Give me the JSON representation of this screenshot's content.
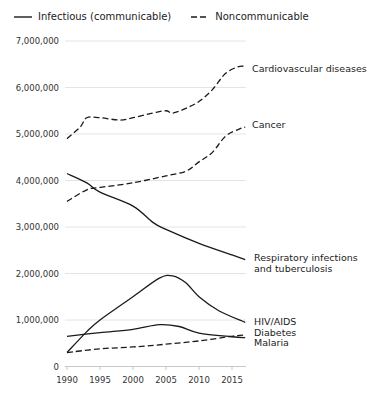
{
  "chart_data": {
    "type": "line",
    "title": "",
    "xlabel": "",
    "ylabel": "",
    "xlim": [
      1990,
      2017
    ],
    "ylim": [
      0,
      7000000
    ],
    "grid": true,
    "legend_position": "top-left",
    "legend": [
      {
        "label": "Infectious (communicable)",
        "style": "solid"
      },
      {
        "label": "Noncommunicable",
        "style": "dashed"
      }
    ],
    "x_ticks": [
      "1990",
      "1995",
      "2000",
      "2005",
      "2010",
      "2015"
    ],
    "y_ticks": [
      "0",
      "1,000,000",
      "2,000,000",
      "3,000,000",
      "4,000,000",
      "5,000,000",
      "6,000,000",
      "7,000,000"
    ],
    "series": [
      {
        "name": "Cardiovascular diseases",
        "group": "Noncommunicable",
        "style": "dashed",
        "x": [
          1990,
          1992,
          1993,
          1995,
          1998,
          2000,
          2003,
          2005,
          2006,
          2008,
          2010,
          2012,
          2014,
          2016,
          2017
        ],
        "values": [
          4900000,
          5150000,
          5350000,
          5350000,
          5300000,
          5350000,
          5450000,
          5500000,
          5450000,
          5550000,
          5700000,
          5950000,
          6300000,
          6450000,
          6450000
        ]
      },
      {
        "name": "Cancer",
        "group": "Noncommunicable",
        "style": "dashed",
        "x": [
          1990,
          1993,
          1995,
          2000,
          2005,
          2008,
          2010,
          2012,
          2014,
          2016,
          2017
        ],
        "values": [
          3550000,
          3800000,
          3850000,
          3950000,
          4100000,
          4200000,
          4400000,
          4600000,
          4950000,
          5100000,
          5150000
        ]
      },
      {
        "name": "Respiratory infections and tuberculosis",
        "group": "Infectious (communicable)",
        "style": "solid",
        "x": [
          1990,
          1993,
          1995,
          2000,
          2003,
          2005,
          2010,
          2015,
          2017
        ],
        "values": [
          4150000,
          3950000,
          3750000,
          3450000,
          3100000,
          2950000,
          2650000,
          2400000,
          2300000
        ]
      },
      {
        "name": "HIV/AIDS",
        "group": "Infectious (communicable)",
        "style": "solid",
        "x": [
          1990,
          1993,
          1995,
          2000,
          2004,
          2006,
          2008,
          2010,
          2013,
          2017
        ],
        "values": [
          300000,
          750000,
          1000000,
          1500000,
          1900000,
          1950000,
          1800000,
          1500000,
          1200000,
          950000
        ]
      },
      {
        "name": "Diabetes",
        "group": "Noncommunicable",
        "style": "dashed",
        "x": [
          1990,
          1995,
          2000,
          2005,
          2010,
          2015,
          2017
        ],
        "values": [
          300000,
          380000,
          420000,
          480000,
          550000,
          650000,
          680000
        ]
      },
      {
        "name": "Malaria",
        "group": "Infectious (communicable)",
        "style": "solid",
        "x": [
          1990,
          1995,
          2000,
          2004,
          2007,
          2010,
          2015,
          2017
        ],
        "values": [
          650000,
          730000,
          800000,
          900000,
          860000,
          720000,
          640000,
          620000
        ]
      }
    ]
  },
  "legend": {
    "solid_label": "Infectious (communicable)",
    "dashed_label": "Noncommunicable"
  },
  "labels": {
    "cardio": "Cardiovascular diseases",
    "cancer": "Cancer",
    "resp_line1": "Respiratory infections",
    "resp_line2": "and tuberculosis",
    "hiv": "HIV/AIDS",
    "diabetes": "Diabetes",
    "malaria": "Malaria"
  },
  "axis": {
    "y": [
      "7,000,000",
      "6,000,000",
      "5,000,000",
      "4,000,000",
      "3,000,000",
      "2,000,000",
      "1,000,000",
      "0"
    ],
    "x": [
      "1990",
      "1995",
      "2000",
      "2005",
      "2010",
      "2015"
    ]
  }
}
